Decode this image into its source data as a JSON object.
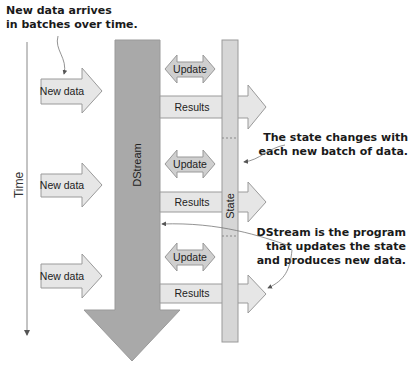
{
  "annotations": {
    "new_data_top": [
      "New data arrives",
      "in batches over time."
    ],
    "state_changes": [
      "The state changes with",
      "each new batch of data."
    ],
    "dstream_program": [
      "DStream is the program",
      "that updates the state",
      "and produces new data."
    ]
  },
  "axis": {
    "time_label": "Time"
  },
  "dstream": {
    "label": "DStream"
  },
  "state": {
    "label": "State"
  },
  "batches": [
    {
      "new_data": "New data",
      "update": "Update",
      "results": "Results"
    },
    {
      "new_data": "New data",
      "update": "Update",
      "results": "Results"
    },
    {
      "new_data": "New data",
      "update": "Update",
      "results": "Results"
    }
  ],
  "colors": {
    "dstream_fill": "#a9a9a9",
    "state_fill": "#d4d4d4",
    "arrow_fill": "#e6e6e6",
    "update_fill": "#cfcfcf",
    "stroke": "#8a8a8a",
    "text": "#1a1a1a"
  }
}
